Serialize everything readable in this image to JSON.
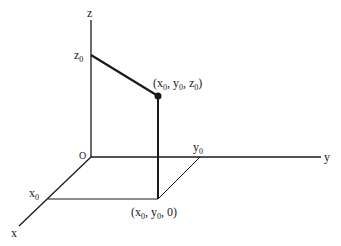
{
  "diagram": {
    "type": "3d-coordinate-axes",
    "axes": {
      "x": {
        "label": "x"
      },
      "y": {
        "label": "y"
      },
      "z": {
        "label": "z"
      }
    },
    "origin": {
      "label": "O"
    },
    "ticks": {
      "x0": {
        "base": "x",
        "sub": "0"
      },
      "y0": {
        "base": "y",
        "sub": "0"
      },
      "z0": {
        "base": "z",
        "sub": "0"
      }
    },
    "points": {
      "p": {
        "open": "(x",
        "s1": "0",
        "m1": ", y",
        "s2": "0",
        "m2": ", z",
        "s3": "0",
        "close": ")"
      },
      "q": {
        "open": "(x",
        "s1": "0",
        "m1": ", y",
        "s2": "0",
        "close": ", 0)"
      }
    },
    "colors": {
      "line": "#1a1a1a",
      "background": "#ffffff"
    }
  }
}
